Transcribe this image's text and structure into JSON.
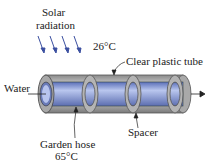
{
  "diagram": {
    "labels": {
      "solar": "Solar",
      "radiation": "radiation",
      "ambient_temp": "26°C",
      "tube": "Clear plastic tube",
      "water": "Water",
      "spacer": "Spacer",
      "hose": "Garden hose",
      "hose_temp": "65°C"
    },
    "colors": {
      "arrow_blue": "#3b4fa0",
      "tube_gray": "#9a9a9a",
      "hose_blue": "#7f93d6"
    }
  }
}
